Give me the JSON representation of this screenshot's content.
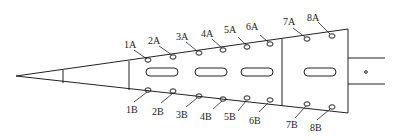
{
  "diagram": {
    "title": "",
    "stroke_color": "#222222",
    "background": "#ffffff",
    "top_labels": [
      "1A",
      "2A",
      "3A",
      "4A",
      "5A",
      "6A",
      "7A",
      "8A"
    ],
    "bottom_labels": [
      "1B",
      "2B",
      "3B",
      "4B",
      "5B",
      "6B",
      "7B",
      "8B"
    ],
    "slots": 4,
    "components": [
      "tip-cone",
      "tapered-body",
      "rear-section",
      "shaft"
    ]
  }
}
